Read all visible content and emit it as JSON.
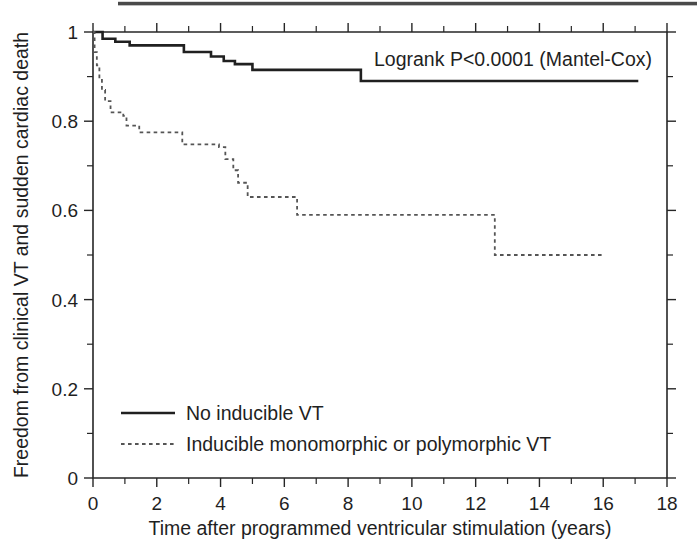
{
  "figure": {
    "background_color": "#ffffff",
    "ink_color": "#1f1f1f"
  },
  "annotation": {
    "logrank": "Logrank P<0.0001 (Mantel-Cox)"
  },
  "axes": {
    "x_title": "Time after programmed ventricular stimulation (years)",
    "y_title": "Freedom from clinical VT and sudden cardiac death",
    "x_ticks": [
      "0",
      "2",
      "4",
      "6",
      "8",
      "10",
      "12",
      "14",
      "16",
      "18"
    ],
    "y_ticks": [
      "0",
      "0.2",
      "0.4",
      "0.6",
      "0.8",
      "1"
    ]
  },
  "legend": {
    "items": [
      {
        "label": "No inducible VT",
        "style": "solid",
        "color": "#202020"
      },
      {
        "label": "Inducible monomorphic or polymorphic VT",
        "style": "dashed",
        "color": "#555555"
      }
    ]
  },
  "chart_data": {
    "type": "line",
    "subtype": "kaplan-meier-step",
    "title": "",
    "xlabel": "Time after programmed ventricular stimulation (years)",
    "ylabel": "Freedom from clinical VT and sudden cardiac death",
    "xlim": [
      0,
      18
    ],
    "ylim": [
      0,
      1
    ],
    "xticks": [
      0,
      2,
      4,
      6,
      8,
      10,
      12,
      14,
      16,
      18
    ],
    "xticks_minor_step": 1,
    "yticks": [
      0,
      0.2,
      0.4,
      0.6,
      0.8,
      1.0
    ],
    "yticks_minor_step": 0.1,
    "grid": false,
    "legend_position": "lower-left-inside",
    "annotations": [
      {
        "text": "Logrank P<0.0001 (Mantel-Cox)",
        "x": 11.2,
        "y": 0.965
      }
    ],
    "series": [
      {
        "name": "No inducible VT",
        "style": "solid",
        "color": "#202020",
        "points": [
          [
            0.0,
            1.0
          ],
          [
            0.3,
            1.0
          ],
          [
            0.3,
            0.985
          ],
          [
            0.7,
            0.985
          ],
          [
            0.7,
            0.978
          ],
          [
            1.15,
            0.978
          ],
          [
            1.15,
            0.97
          ],
          [
            2.85,
            0.97
          ],
          [
            2.85,
            0.955
          ],
          [
            3.7,
            0.955
          ],
          [
            3.7,
            0.945
          ],
          [
            4.1,
            0.945
          ],
          [
            4.1,
            0.935
          ],
          [
            4.45,
            0.935
          ],
          [
            4.45,
            0.928
          ],
          [
            5.0,
            0.928
          ],
          [
            5.0,
            0.915
          ],
          [
            8.4,
            0.915
          ],
          [
            8.4,
            0.89
          ],
          [
            17.1,
            0.89
          ]
        ]
      },
      {
        "name": "Inducible monomorphic or polymorphic VT",
        "style": "dashed",
        "color": "#555555",
        "points": [
          [
            0.0,
            1.0
          ],
          [
            0.05,
            1.0
          ],
          [
            0.05,
            0.955
          ],
          [
            0.12,
            0.955
          ],
          [
            0.12,
            0.925
          ],
          [
            0.2,
            0.925
          ],
          [
            0.2,
            0.895
          ],
          [
            0.28,
            0.895
          ],
          [
            0.28,
            0.87
          ],
          [
            0.38,
            0.87
          ],
          [
            0.38,
            0.845
          ],
          [
            0.55,
            0.845
          ],
          [
            0.55,
            0.82
          ],
          [
            0.95,
            0.82
          ],
          [
            0.95,
            0.812
          ],
          [
            1.05,
            0.812
          ],
          [
            1.05,
            0.79
          ],
          [
            1.45,
            0.79
          ],
          [
            1.45,
            0.775
          ],
          [
            2.8,
            0.775
          ],
          [
            2.8,
            0.748
          ],
          [
            3.95,
            0.748
          ],
          [
            3.95,
            0.742
          ],
          [
            4.15,
            0.742
          ],
          [
            4.15,
            0.715
          ],
          [
            4.4,
            0.715
          ],
          [
            4.4,
            0.69
          ],
          [
            4.55,
            0.69
          ],
          [
            4.55,
            0.662
          ],
          [
            4.85,
            0.662
          ],
          [
            4.85,
            0.63
          ],
          [
            6.4,
            0.63
          ],
          [
            6.4,
            0.59
          ],
          [
            12.6,
            0.59
          ],
          [
            12.6,
            0.5
          ],
          [
            16.05,
            0.5
          ]
        ]
      }
    ]
  }
}
